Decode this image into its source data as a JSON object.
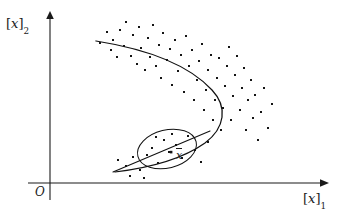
{
  "figure": {
    "domain": "Chart",
    "caption_text": "",
    "background_color": "#ffffff",
    "ink_color": "#141414",
    "width": 345,
    "height": 213
  },
  "axes": {
    "origin_label": "O",
    "x_axis_label_bracket_open": "[",
    "x_axis_label_var": "x",
    "x_axis_label_bracket_close": "]",
    "x_axis_label_sub": "1",
    "y_axis_label_bracket_open": "[",
    "y_axis_label_var": "x",
    "y_axis_label_bracket_close": "]",
    "y_axis_label_sub": "2",
    "x_axis_label_full": "[x]1",
    "y_axis_label_full": "[x]2",
    "origin_px": {
      "x": 50,
      "y": 183
    },
    "x_axis_end_px": {
      "x": 325,
      "y": 183
    },
    "y_axis_end_px": {
      "x": 50,
      "y": 14
    },
    "ticks": [],
    "grid": false
  },
  "annotations": {
    "mean_point_label": "x",
    "mean_point_has_overbar": true,
    "mean_point_px": {
      "x": 171,
      "y": 152
    },
    "ellipse": {
      "center_px": {
        "x": 167,
        "y": 149
      },
      "rx": 30,
      "ry": 19,
      "rotation_deg": -14
    },
    "tangent_line": {
      "start_px": {
        "x": 113,
        "y": 172
      },
      "end_px": {
        "x": 210,
        "y": 131
      }
    }
  },
  "chart_data": {
    "type": "scatter",
    "title": "",
    "subtitle": "",
    "xlabel": "[x]1",
    "ylabel": "[x]2",
    "xlim": [
      50,
      325
    ],
    "ylim": [
      183,
      14
    ],
    "grid": false,
    "legend": null,
    "series": [
      {
        "name": "samples",
        "marker": "square-dot",
        "marker_size_px": 2.0,
        "color": "#141414",
        "points": [
          [
            100,
            43
          ],
          [
            107,
            32
          ],
          [
            111,
            50
          ],
          [
            113,
            40
          ],
          [
            117,
            57
          ],
          [
            120,
            30
          ],
          [
            124,
            46
          ],
          [
            126,
            22
          ],
          [
            131,
            56
          ],
          [
            133,
            35
          ],
          [
            137,
            64
          ],
          [
            139,
            27
          ],
          [
            141,
            48
          ],
          [
            145,
            70
          ],
          [
            148,
            38
          ],
          [
            150,
            57
          ],
          [
            153,
            25
          ],
          [
            156,
            66
          ],
          [
            159,
            45
          ],
          [
            161,
            78
          ],
          [
            163,
            33
          ],
          [
            167,
            60
          ],
          [
            170,
            49
          ],
          [
            172,
            85
          ],
          [
            175,
            40
          ],
          [
            178,
            71
          ],
          [
            181,
            55
          ],
          [
            184,
            92
          ],
          [
            186,
            36
          ],
          [
            189,
            66
          ],
          [
            192,
            50
          ],
          [
            194,
            100
          ],
          [
            197,
            80
          ],
          [
            199,
            61
          ],
          [
            202,
            44
          ],
          [
            204,
            110
          ],
          [
            206,
            90
          ],
          [
            208,
            70
          ],
          [
            211,
            55
          ],
          [
            213,
            120
          ],
          [
            215,
            100
          ],
          [
            217,
            78
          ],
          [
            219,
            58
          ],
          [
            221,
            130
          ],
          [
            223,
            108
          ],
          [
            225,
            86
          ],
          [
            227,
            66
          ],
          [
            229,
            47
          ],
          [
            231,
            120
          ],
          [
            233,
            96
          ],
          [
            235,
            75
          ],
          [
            237,
            56
          ],
          [
            240,
            110
          ],
          [
            242,
            88
          ],
          [
            244,
            68
          ],
          [
            246,
            130
          ],
          [
            248,
            100
          ],
          [
            251,
            80
          ],
          [
            253,
            118
          ],
          [
            255,
            95
          ],
          [
            258,
            140
          ],
          [
            261,
            112
          ],
          [
            264,
            88
          ],
          [
            268,
            128
          ],
          [
            272,
            104
          ],
          [
            118,
            160
          ],
          [
            126,
            166
          ],
          [
            133,
            157
          ],
          [
            140,
            170
          ],
          [
            147,
            155
          ],
          [
            152,
            148
          ],
          [
            158,
            163
          ],
          [
            164,
            140
          ],
          [
            169,
            152
          ],
          [
            176,
            145
          ],
          [
            182,
            158
          ],
          [
            188,
            136
          ],
          [
            195,
            150
          ],
          [
            201,
            162
          ],
          [
            208,
            142
          ],
          [
            130,
            176
          ],
          [
            144,
            178
          ],
          [
            172,
            134
          ],
          [
            156,
            137
          ]
        ]
      }
    ]
  }
}
